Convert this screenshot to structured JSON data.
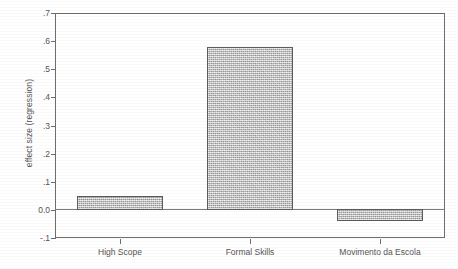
{
  "chart_data": {
    "type": "bar",
    "title": "",
    "subtitle": "",
    "xlabel": "",
    "ylabel": "effect size (regression)",
    "categories": [
      "High Scope",
      "Formal Skills",
      "Movimento da Escola"
    ],
    "values": [
      0.045,
      0.575,
      -0.04
    ],
    "series": [
      {
        "name": "effect size (regression)",
        "values": [
          0.045,
          0.575,
          -0.04
        ]
      }
    ],
    "ylim": [
      -0.1,
      0.7
    ],
    "ytick_labels": [
      ".7",
      ".6",
      ".5",
      ".4",
      ".3",
      ".2",
      ".1",
      "0.0",
      "-.1"
    ],
    "ytick_values": [
      0.7,
      0.6,
      0.5,
      0.4,
      0.3,
      0.2,
      0.1,
      0.0,
      -0.1
    ],
    "grid": false,
    "legend": "none",
    "zero_line": 0.0,
    "bar_fill_color": "#c4c4c4",
    "bar_border_color": "#5c5c5c",
    "axis_color": "#6e6e6e",
    "text_color": "#555555",
    "background_color": "#ffffff"
  }
}
